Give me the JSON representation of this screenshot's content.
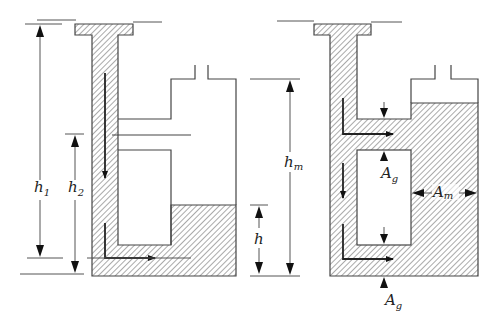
{
  "figure": {
    "left_panel": {
      "labels": {
        "h1": {
          "main": "h",
          "sub": "1"
        },
        "h2": {
          "main": "h",
          "sub": "2"
        }
      }
    },
    "right_panel": {
      "labels": {
        "hm": {
          "main": "h",
          "sub": "m"
        },
        "h": {
          "main": "h",
          "sub": ""
        },
        "Ag_top": {
          "main": "A",
          "sub": "g"
        },
        "Ag_bottom": {
          "main": "A",
          "sub": "g"
        },
        "Am": {
          "main": "A",
          "sub": "m"
        }
      }
    },
    "colors": {
      "stroke": "#444444",
      "hatch": "#555555",
      "background": "#ffffff"
    }
  }
}
